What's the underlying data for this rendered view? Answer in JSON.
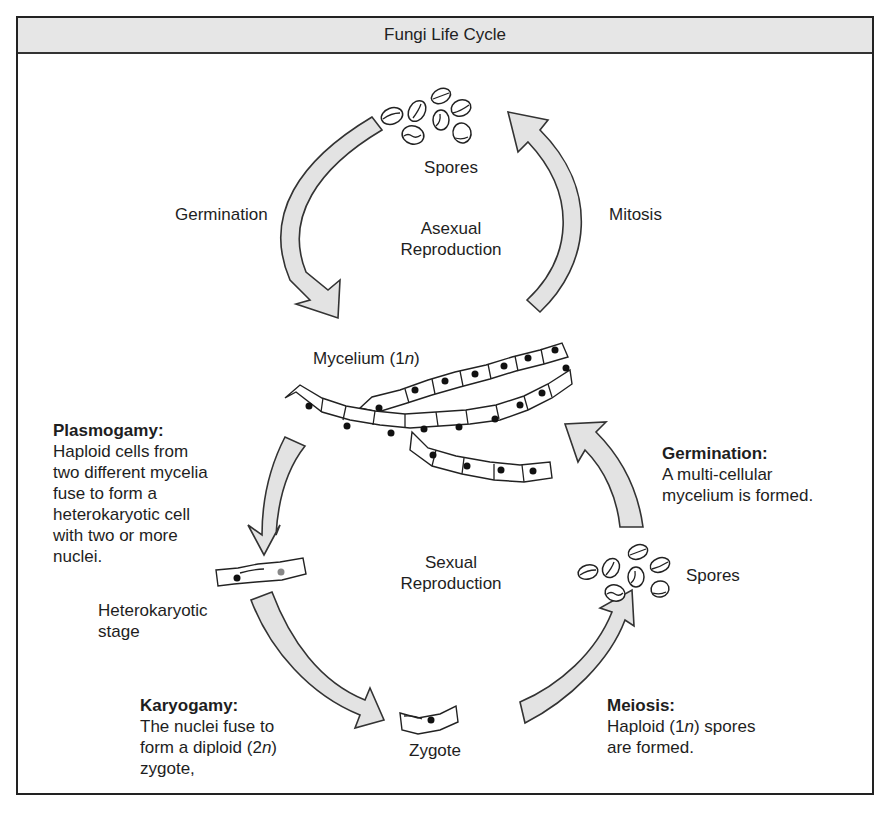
{
  "title": "Fungi Life Cycle",
  "asexual": {
    "center_label_line1": "Asexual",
    "center_label_line2": "Reproduction",
    "spores_label": "Spores",
    "left_arrow_label": "Germination",
    "right_arrow_label": "Mitosis"
  },
  "mycelium": {
    "label_prefix": "Mycelium (1",
    "label_italic": "n",
    "label_suffix": ")"
  },
  "sexual": {
    "center_label_line1": "Sexual",
    "center_label_line2": "Reproduction",
    "plasmogamy": {
      "heading": "Plasmogamy:",
      "lines": [
        "Haploid cells from",
        "two different mycelia",
        "fuse to form a",
        "heterokaryotic cell",
        "with two or more",
        "nuclei."
      ]
    },
    "heterokaryotic": {
      "line1": "Heterokaryotic",
      "line2": "stage"
    },
    "karyogamy": {
      "heading": "Karyogamy:",
      "line1": "The nuclei fuse to",
      "line2_prefix": "form a diploid (2",
      "line2_italic": "n",
      "line2_suffix": ")",
      "line3": "zygote,"
    },
    "zygote_label": "Zygote",
    "meiosis": {
      "heading": "Meiosis:",
      "line1_prefix": "Haploid (1",
      "line1_italic": "n",
      "line1_suffix": ") spores",
      "line2": "are formed."
    },
    "spores_label": "Spores",
    "germination": {
      "heading": "Germination:",
      "line1": "A multi-cellular",
      "line2": "mycelium is formed."
    }
  },
  "colors": {
    "title_bg": "#e6e6e6",
    "arrow_fill": "#e3e3e3",
    "outline": "#222222"
  }
}
